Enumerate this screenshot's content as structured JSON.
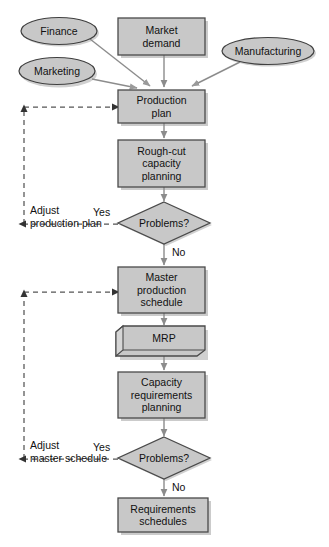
{
  "diagram": {
    "colors": {
      "node_fill": "#c8c8c8",
      "node_stroke": "#4a4a4a",
      "shadow": "#b4b4b4",
      "solid_arrow": "#8c8c8c",
      "dashed_arrow": "#555555",
      "text": "#111111",
      "background": "#ffffff"
    },
    "inputs": [
      {
        "id": "finance",
        "shape": "ellipse",
        "label": "Finance"
      },
      {
        "id": "marketing",
        "shape": "ellipse",
        "label": "Marketing"
      },
      {
        "id": "manufacturing",
        "shape": "ellipse",
        "label": "Manufacturing"
      }
    ],
    "nodes": [
      {
        "id": "market-demand",
        "shape": "rectangle",
        "lines": [
          "Market",
          "demand"
        ]
      },
      {
        "id": "production-plan",
        "shape": "rectangle",
        "lines": [
          "Production",
          "plan"
        ]
      },
      {
        "id": "rough-cut-capacity-planning",
        "shape": "rectangle",
        "lines": [
          "Rough-cut",
          "capacity",
          "planning"
        ]
      },
      {
        "id": "problems-decision-1",
        "shape": "diamond",
        "lines": [
          "Problems?"
        ]
      },
      {
        "id": "master-production-schedule",
        "shape": "rectangle",
        "lines": [
          "Master",
          "production",
          "schedule"
        ]
      },
      {
        "id": "mrp",
        "shape": "process-3d",
        "lines": [
          "MRP"
        ]
      },
      {
        "id": "capacity-requirements-planning",
        "shape": "rectangle",
        "lines": [
          "Capacity",
          "requirements",
          "planning"
        ]
      },
      {
        "id": "problems-decision-2",
        "shape": "diamond",
        "lines": [
          "Problems?"
        ]
      },
      {
        "id": "requirements-schedules",
        "shape": "rectangle",
        "lines": [
          "Requirements",
          "schedules"
        ]
      }
    ],
    "edge_labels": {
      "yes_1": "Yes",
      "no_1": "No",
      "yes_2": "Yes",
      "no_2": "No",
      "adjust_production_plan_line1": "Adjust",
      "adjust_production_plan_line2": "production plan",
      "adjust_master_schedule_line1": "Adjust",
      "adjust_master_schedule_line2": "master schedule"
    }
  }
}
